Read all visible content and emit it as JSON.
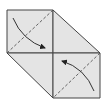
{
  "diagram": {
    "type": "origami-fold-step",
    "fill_color": "#e4e4e4",
    "stroke_color": "#444444",
    "shapes": {
      "top_left_square": [
        [
          7,
          10
        ],
        [
          53,
          10
        ],
        [
          53,
          53
        ],
        [
          7,
          53
        ]
      ],
      "top_right_flap": [
        [
          53,
          10
        ],
        [
          100,
          53
        ],
        [
          53,
          53
        ]
      ],
      "bottom_left_flap": [
        [
          7,
          53
        ],
        [
          53,
          53
        ],
        [
          53,
          98
        ]
      ],
      "bottom_right_square": [
        [
          53,
          53
        ],
        [
          100,
          53
        ],
        [
          100,
          98
        ],
        [
          53,
          98
        ]
      ]
    },
    "dashed_lines": [
      {
        "name": "upper-diagonal",
        "from": [
          53,
          10
        ],
        "to": [
          7,
          53
        ]
      },
      {
        "name": "lower-diagonal",
        "from": [
          100,
          53
        ],
        "to": [
          53,
          98
        ]
      }
    ],
    "arrows": [
      {
        "name": "fold-arrow-top",
        "direction": "down-right"
      },
      {
        "name": "fold-arrow-bottom",
        "direction": "up-left"
      }
    ]
  }
}
